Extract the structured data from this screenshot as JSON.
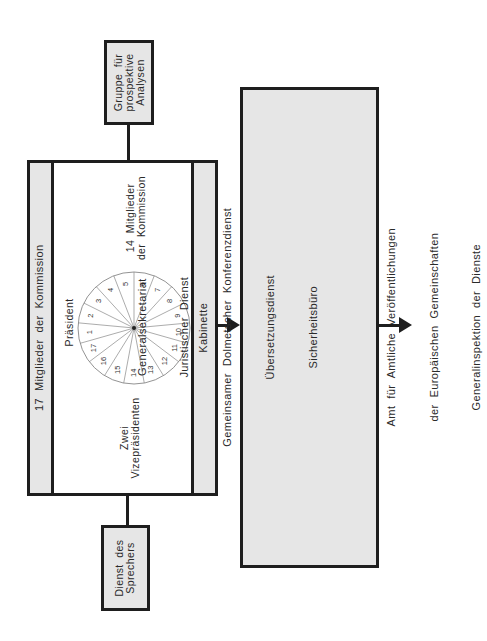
{
  "diagram": {
    "colors": {
      "box_fill": "#e6e6e6",
      "border": "#1e1e1e",
      "text": "#2a2a2a"
    },
    "top_box": {
      "label": "Gruppe  für\nprospektive\nAnalysen"
    },
    "bottom_box": {
      "label": "Dienst  des\nSprechers"
    },
    "commission": {
      "left_band_label": "17  Mitglieder  der  Kommission",
      "right_band_label": "Kabinette",
      "president_label": "Präsident",
      "members_label": "14  Mitglieder\nder  Kommission",
      "vice_presidents_label": "Zwei\nVizepräsidenten",
      "wheel": {
        "segment_count": 17,
        "numbers_clockwise_from_top": [
          "6",
          "7",
          "8",
          "9",
          "10",
          "11",
          "12",
          "13",
          "14",
          "15",
          "16",
          "17",
          "1",
          "2",
          "3",
          "4",
          "5"
        ]
      }
    },
    "services_box": {
      "lines": [
        "Generalsekretariat",
        "Juristischer  Dienst",
        "Gemeinsamer  Dolmetscher  Konferenzdienst",
        "Übersetzungsdienst",
        "Sicherheitsbüro",
        "",
        "Amt  für  Amtliche  Veröffentlichungen",
        "der  Europäischen  Gemeinschaften",
        "Generalinspektion  der  Dienste"
      ]
    },
    "arrows": [
      {
        "from": "commission",
        "to": "services_box"
      },
      {
        "from": "services_box",
        "to": "outside"
      }
    ]
  }
}
